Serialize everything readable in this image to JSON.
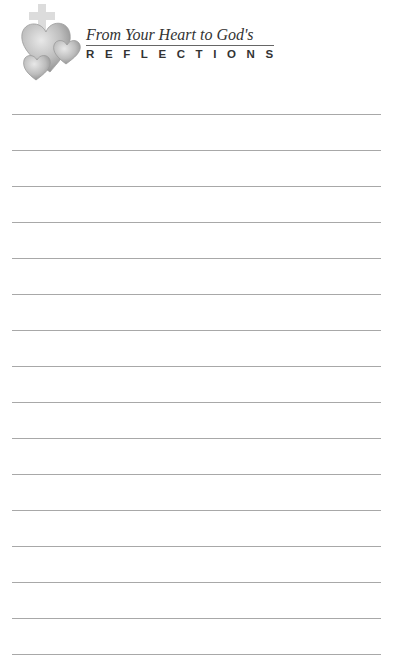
{
  "header": {
    "subtitle": "From Your Heart to God's",
    "title": "REFLECTIONS",
    "logo_icon": "hearts-and-cross-icon"
  },
  "writing_lines": {
    "count": 16,
    "color": "#a8a8a8"
  }
}
